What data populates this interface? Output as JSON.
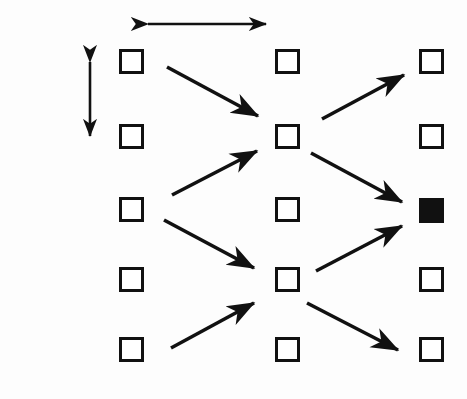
{
  "figure": {
    "background_color": "#fdfdfd",
    "ink_color": "#111111"
  },
  "column_labels": [
    {
      "text": "j",
      "x": 131,
      "y": 16
    },
    {
      "text": "j+1",
      "x": 270,
      "y": 16
    },
    {
      "text": "j+2",
      "x": 415,
      "y": 16
    }
  ],
  "row_labels": [
    {
      "text": "i+2",
      "x": 26,
      "y": 58
    },
    {
      "text": "i+1",
      "x": 26,
      "y": 128
    },
    {
      "text": "i",
      "x": 26,
      "y": 201
    },
    {
      "text": "i-1",
      "x": 26,
      "y": 271
    },
    {
      "text": "i-2",
      "x": 26,
      "y": 341
    }
  ],
  "spacing_annotations": [
    {
      "name": "delta-t",
      "text": "δt",
      "orientation": "horizontal",
      "label_x": 199,
      "label_y": 16,
      "x1": 148,
      "y1": 24,
      "x2": 266,
      "y2": 24
    },
    {
      "name": "delta-x",
      "text": "δx",
      "orientation": "vertical",
      "label_x": 66,
      "label_y": 91,
      "x1": 90,
      "y1": 62,
      "x2": 90,
      "y2": 136
    }
  ],
  "grid": {
    "columns": [
      "j",
      "j+1",
      "j+2"
    ],
    "rows": [
      "i+2",
      "i+1",
      "i",
      "i-1",
      "i-2"
    ],
    "column_x": [
      119,
      275,
      419
    ],
    "row_y": [
      49,
      124,
      197,
      267,
      337
    ],
    "node_size": 25
  },
  "nodes": [
    {
      "row": "i+2",
      "col": "j",
      "x": 119,
      "y": 49,
      "filled": false
    },
    {
      "row": "i+1",
      "col": "j",
      "x": 119,
      "y": 124,
      "filled": false
    },
    {
      "row": "i",
      "col": "j",
      "x": 119,
      "y": 197,
      "filled": false
    },
    {
      "row": "i-1",
      "col": "j",
      "x": 119,
      "y": 267,
      "filled": false
    },
    {
      "row": "i-2",
      "col": "j",
      "x": 119,
      "y": 337,
      "filled": false
    },
    {
      "row": "i+2",
      "col": "j+1",
      "x": 275,
      "y": 49,
      "filled": false
    },
    {
      "row": "i+1",
      "col": "j+1",
      "x": 275,
      "y": 124,
      "filled": false
    },
    {
      "row": "i",
      "col": "j+1",
      "x": 275,
      "y": 197,
      "filled": false
    },
    {
      "row": "i-1",
      "col": "j+1",
      "x": 275,
      "y": 267,
      "filled": false
    },
    {
      "row": "i-2",
      "col": "j+1",
      "x": 275,
      "y": 337,
      "filled": false
    },
    {
      "row": "i+2",
      "col": "j+2",
      "x": 419,
      "y": 49,
      "filled": false
    },
    {
      "row": "i+1",
      "col": "j+2",
      "x": 419,
      "y": 124,
      "filled": false
    },
    {
      "row": "i",
      "col": "j+2",
      "x": 419,
      "y": 198,
      "filled": true
    },
    {
      "row": "i-1",
      "col": "j+2",
      "x": 419,
      "y": 267,
      "filled": false
    },
    {
      "row": "i-2",
      "col": "j+2",
      "x": 419,
      "y": 337,
      "filled": false
    }
  ],
  "arrows": [
    {
      "name": "arrow-i2j-to-i1j1",
      "from": "i+2,j",
      "to": "i+1,j+1",
      "x1": 167,
      "y1": 67,
      "x2": 258,
      "y2": 116
    },
    {
      "name": "arrow-ij-to-i1j1",
      "from": "i,j",
      "to": "i+1,j+1",
      "x1": 172,
      "y1": 195,
      "x2": 257,
      "y2": 151
    },
    {
      "name": "arrow-ij-to-im1j1",
      "from": "i,j",
      "to": "i-1,j+1",
      "x1": 164,
      "y1": 220,
      "x2": 254,
      "y2": 268
    },
    {
      "name": "arrow-im2j-to-im1j1",
      "from": "i-2,j",
      "to": "i-1,j+1",
      "x1": 171,
      "y1": 348,
      "x2": 254,
      "y2": 303
    },
    {
      "name": "arrow-i1j1-to-i2j2",
      "from": "i+1,j+1",
      "to": "i+2,j+2",
      "x1": 322,
      "y1": 119,
      "x2": 404,
      "y2": 75
    },
    {
      "name": "arrow-i1j1-to-ij2",
      "from": "i+1,j+1",
      "to": "i,j+2",
      "x1": 311,
      "y1": 153,
      "x2": 402,
      "y2": 202
    },
    {
      "name": "arrow-im1j1-to-ij2",
      "from": "i-1,j+1",
      "to": "i,j+2",
      "x1": 316,
      "y1": 271,
      "x2": 402,
      "y2": 226
    },
    {
      "name": "arrow-im1j1-to-im2j2",
      "from": "i-1,j+1",
      "to": "i-2,j+2",
      "x1": 307,
      "y1": 303,
      "x2": 398,
      "y2": 350
    }
  ]
}
